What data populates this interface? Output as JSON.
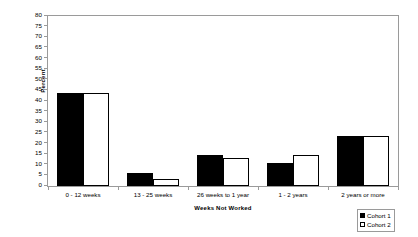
{
  "chart_data": {
    "type": "bar",
    "title": "",
    "subtitle": "",
    "xlabel": "Weeks Not Worked",
    "ylabel": "Percent",
    "ylim": [
      0,
      80
    ],
    "ytick_step": 5,
    "yticks": [
      80,
      75,
      70,
      65,
      60,
      55,
      50,
      45,
      40,
      35,
      30,
      25,
      20,
      15,
      10,
      5,
      0
    ],
    "grid": false,
    "legend_position": "bottom-right",
    "categories": [
      "0 - 12 weeks",
      "13 - 25 weeks",
      "26 weeks to 1 year",
      "1 - 2 years",
      "2 years or more"
    ],
    "series": [
      {
        "name": "Cohort 1",
        "color": "#000000",
        "values": [
          44,
          6,
          14.5,
          11,
          23.5
        ]
      },
      {
        "name": "Cohort 2",
        "color": "#ffffff",
        "values": [
          44,
          3.5,
          13,
          14.5,
          23.5
        ]
      }
    ]
  },
  "legend": {
    "items": [
      {
        "label": "Cohort 1"
      },
      {
        "label": "Cohort 2"
      }
    ]
  },
  "colors": {
    "series_1": "#000000",
    "series_2": "#ffffff",
    "frame": "#9a9a9a",
    "text": "#000000",
    "background": "#ffffff"
  }
}
